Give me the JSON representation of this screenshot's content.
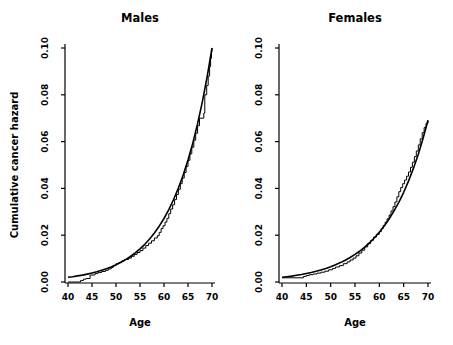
{
  "figure": {
    "background": "#ffffff",
    "line_color": "#000000"
  },
  "chart_data": [
    {
      "type": "line",
      "title": "Males",
      "xlabel": "Age",
      "ylabel": "Cumulative cancer hazard",
      "xlim": [
        40,
        70
      ],
      "ylim": [
        0.0,
        0.1
      ],
      "x_ticks": [
        40,
        45,
        50,
        55,
        60,
        65,
        70
      ],
      "y_ticks": [
        0.0,
        0.02,
        0.04,
        0.06,
        0.08,
        0.1
      ],
      "grid": false,
      "legend": "none",
      "line_color": "#000000",
      "series": [
        {
          "name": "smooth-fitted-hazard",
          "style": "smooth",
          "x": [
            40,
            41,
            42,
            43,
            44,
            45,
            46,
            47,
            48,
            49,
            50,
            51,
            52,
            53,
            54,
            55,
            56,
            57,
            58,
            59,
            60,
            61,
            62,
            63,
            64,
            65,
            66,
            67,
            68,
            69,
            70
          ],
          "y": [
            0.002,
            0.00228,
            0.0026,
            0.00296,
            0.00337,
            0.00384,
            0.00438,
            0.00499,
            0.00568,
            0.00647,
            0.00737,
            0.0084,
            0.00957,
            0.0109,
            0.01242,
            0.01415,
            0.01612,
            0.01836,
            0.02092,
            0.02383,
            0.02715,
            0.03093,
            0.03524,
            0.04015,
            0.04574,
            0.05212,
            0.05938,
            0.06765,
            0.07707,
            0.08781,
            0.1
          ]
        },
        {
          "name": "nelson-aalen-step-estimate",
          "style": "step",
          "x": [
            40,
            42.6,
            43.2,
            43.8,
            44.6,
            45.6,
            46.2,
            47.0,
            47.8,
            48.4,
            49.0,
            49.4,
            50.0,
            50.6,
            51.2,
            51.8,
            52.6,
            53.2,
            53.8,
            54.4,
            55.0,
            55.6,
            56.2,
            56.8,
            57.4,
            58.0,
            58.6,
            59.0,
            59.4,
            59.8,
            60.2,
            60.6,
            61.0,
            61.4,
            61.8,
            62.2,
            62.6,
            63.0,
            63.4,
            63.8,
            64.2,
            64.6,
            65.0,
            65.4,
            65.8,
            66.2,
            66.6,
            67.0,
            67.4,
            68.3,
            68.5,
            68.9,
            69.2,
            69.5,
            69.7,
            69.9,
            70.0
          ],
          "y": [
            0.0,
            0.0006,
            0.0012,
            0.0015,
            0.003,
            0.0036,
            0.004,
            0.0045,
            0.005,
            0.0056,
            0.0062,
            0.007,
            0.0078,
            0.0083,
            0.009,
            0.0096,
            0.0102,
            0.011,
            0.0118,
            0.0126,
            0.0134,
            0.0145,
            0.0156,
            0.0166,
            0.0176,
            0.0188,
            0.0198,
            0.0212,
            0.0228,
            0.024,
            0.0256,
            0.0272,
            0.0292,
            0.0312,
            0.033,
            0.0352,
            0.0374,
            0.0396,
            0.042,
            0.0444,
            0.0468,
            0.0494,
            0.052,
            0.0548,
            0.0576,
            0.0606,
            0.0636,
            0.0668,
            0.07,
            0.0722,
            0.08,
            0.084,
            0.088,
            0.092,
            0.0956,
            0.0984,
            0.1
          ]
        }
      ]
    },
    {
      "type": "line",
      "title": "Females",
      "xlabel": "Age",
      "ylabel": "",
      "xlim": [
        40,
        70
      ],
      "ylim": [
        0.0,
        0.1
      ],
      "x_ticks": [
        40,
        45,
        50,
        55,
        60,
        65,
        70
      ],
      "y_ticks": [
        0.0,
        0.02,
        0.04,
        0.06,
        0.08,
        0.1
      ],
      "grid": false,
      "legend": "none",
      "line_color": "#000000",
      "series": [
        {
          "name": "smooth-fitted-hazard",
          "style": "smooth",
          "x": [
            40,
            41,
            42,
            43,
            44,
            45,
            46,
            47,
            48,
            49,
            50,
            51,
            52,
            53,
            54,
            55,
            56,
            57,
            58,
            59,
            60,
            61,
            62,
            63,
            64,
            65,
            66,
            67,
            68,
            69,
            70
          ],
          "y": [
            0.00201,
            0.00226,
            0.00254,
            0.00286,
            0.00322,
            0.00362,
            0.00407,
            0.00458,
            0.00516,
            0.0058,
            0.00653,
            0.00735,
            0.00827,
            0.0093,
            0.01047,
            0.01178,
            0.01325,
            0.01491,
            0.01678,
            0.01888,
            0.02125,
            0.02391,
            0.0269,
            0.03027,
            0.03406,
            0.03833,
            0.04313,
            0.04853,
            0.05461,
            0.06145,
            0.06915
          ]
        },
        {
          "name": "nelson-aalen-step-estimate",
          "style": "step",
          "x": [
            40,
            44.4,
            45.0,
            45.6,
            46.4,
            47.2,
            48.0,
            48.8,
            49.6,
            50.4,
            51.0,
            51.8,
            52.6,
            53.4,
            54.0,
            54.6,
            55.2,
            55.8,
            56.4,
            57.0,
            57.6,
            58.2,
            58.8,
            59.4,
            60.0,
            60.4,
            60.8,
            61.2,
            61.6,
            62.0,
            62.4,
            62.8,
            63.2,
            63.6,
            64.0,
            64.4,
            64.8,
            65.2,
            65.6,
            66.0,
            66.4,
            66.8,
            67.2,
            67.6,
            68.0,
            68.4,
            68.8,
            69.2,
            69.6,
            70.0
          ],
          "y": [
            0.0018,
            0.0024,
            0.0028,
            0.0031,
            0.0034,
            0.0038,
            0.0042,
            0.0046,
            0.0052,
            0.0058,
            0.0064,
            0.007,
            0.0078,
            0.0086,
            0.0094,
            0.0102,
            0.0112,
            0.0124,
            0.0136,
            0.015,
            0.0164,
            0.0178,
            0.0192,
            0.0204,
            0.0216,
            0.0228,
            0.0242,
            0.0256,
            0.027,
            0.0286,
            0.0304,
            0.0322,
            0.0342,
            0.0364,
            0.0386,
            0.0404,
            0.042,
            0.0436,
            0.0452,
            0.047,
            0.049,
            0.0512,
            0.0536,
            0.056,
            0.0586,
            0.0612,
            0.0638,
            0.066,
            0.0678,
            0.069
          ]
        }
      ]
    }
  ]
}
